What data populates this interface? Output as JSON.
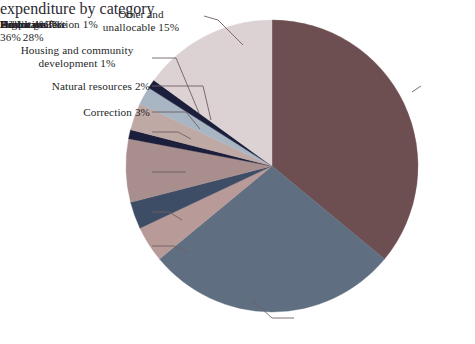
{
  "figure": {
    "cut_off_title_fragment": "expenditure by category",
    "background_color": "#ffffff",
    "label_text_color": "#241f27",
    "leader_line_color": "#6f5f63"
  },
  "chart_data": {
    "type": "pie",
    "title": "",
    "subtitle": "",
    "xlabel": "",
    "ylabel": "",
    "legend_position": "none",
    "grid": false,
    "start_angle_deg": 0,
    "direction": "clockwise",
    "units": "percent",
    "total": 100,
    "categories": [
      "Education",
      "Public welfare",
      "Health",
      "Hospitals",
      "Highways",
      "Police protection",
      "Correction",
      "Natural resources",
      "Housing and community development",
      "Other and unallocable"
    ],
    "values": [
      36,
      28,
      4,
      3,
      7,
      1,
      3,
      2,
      1,
      15
    ],
    "colors": [
      "#6d4f52",
      "#5f6e80",
      "#b89a98",
      "#3e4d66",
      "#a98e8e",
      "#1b1f3b",
      "#bfa9a5",
      "#a8b6c4",
      "#1b1f3b",
      "#dcd2d3"
    ],
    "slices": [
      {
        "label": "Education",
        "value": 36,
        "value_text": "36%",
        "color": "#6d4f52"
      },
      {
        "label": "Public welfare",
        "value": 28,
        "value_text": "28%",
        "color": "#5f6e80"
      },
      {
        "label": "Health",
        "value": 4,
        "value_text": "4%",
        "color": "#b89a98"
      },
      {
        "label": "Hospitals",
        "value": 3,
        "value_text": "3%",
        "color": "#3e4d66"
      },
      {
        "label": "Highways",
        "value": 7,
        "value_text": "7%",
        "color": "#a98e8e"
      },
      {
        "label": "Police protection",
        "value": 1,
        "value_text": "1%",
        "color": "#1b1f3b"
      },
      {
        "label": "Correction",
        "value": 3,
        "value_text": "3%",
        "color": "#bfa9a5"
      },
      {
        "label": "Natural resources",
        "value": 2,
        "value_text": "2%",
        "color": "#a8b6c4"
      },
      {
        "label": "Housing and community development",
        "value": 1,
        "value_text": "1%",
        "color": "#1b1f3b"
      },
      {
        "label": "Other and unallocable",
        "value": 15,
        "value_text": "15%",
        "color": "#dcd2d3"
      }
    ]
  },
  "callouts": {
    "other": "Other and\nunallocable 15%",
    "housing": "Housing and community\ndevelopment 1%",
    "natural": "Natural resources 2%",
    "correction": "Correction 3%",
    "police": "Police protection 1%",
    "highways": "Highways 7%",
    "hospitals": "Hospitals 3%",
    "health": "Health 4%",
    "education": "Education\n36%",
    "welfare": "Public welfare\n28%"
  }
}
